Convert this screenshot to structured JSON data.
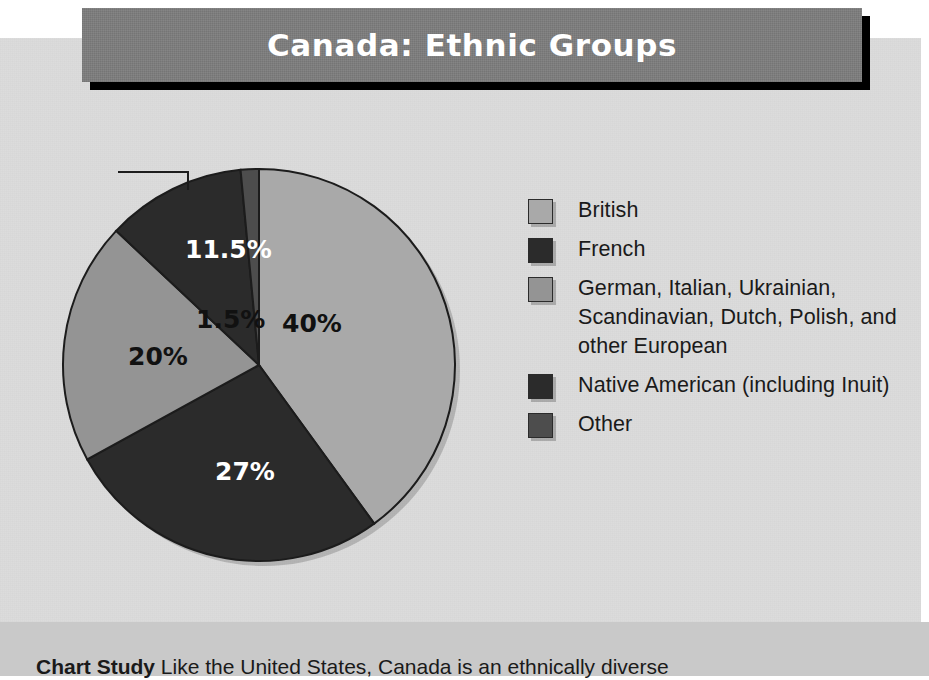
{
  "title": "Canada: Ethnic Groups",
  "caption": {
    "lead": "Chart Study",
    "text": "Like the United States, Canada is an ethnically diverse"
  },
  "colors": {
    "panel_background": "#dcdcdc",
    "page_band": "#c9c9c9",
    "title_bar": "#7d7d7d",
    "title_shadow": "#000000",
    "title_text": "#ffffff",
    "british": "#a9a9a9",
    "french": "#2b2b2b",
    "european": "#949494",
    "native_american": "#2b2b2b",
    "other": "#4d4d4d",
    "outline": "#1c1c1c"
  },
  "legend": {
    "items": [
      {
        "label": "British",
        "color": "#a9a9a9"
      },
      {
        "label": "French",
        "color": "#2b2b2b"
      },
      {
        "label": "German, Italian, Ukrainian, Scandinavian, Dutch, Polish, and other European",
        "color": "#949494"
      },
      {
        "label": "Native American (including Inuit)",
        "color": "#2b2b2b"
      },
      {
        "label": "Other",
        "color": "#4d4d4d"
      }
    ]
  },
  "callout": {
    "label": "1.5%"
  },
  "chart_data": {
    "type": "pie",
    "title": "Canada: Ethnic Groups",
    "start_angle_deg": 0,
    "direction": "clockwise",
    "legend_position": "right",
    "labels_shown": [
      "40%",
      "27%",
      "20%",
      "11.5%",
      "1.5%"
    ],
    "categories": [
      "British",
      "French",
      "German, Italian, Ukrainian, Scandinavian, Dutch, Polish, and other European",
      "Native American (including Inuit)",
      "Other"
    ],
    "values": [
      40,
      27,
      20,
      11.5,
      1.5
    ],
    "slices": [
      {
        "name": "British",
        "value": 40,
        "display": "40%",
        "color": "#a9a9a9",
        "label_fill": "dark",
        "label_x": 282,
        "label_y": 332
      },
      {
        "name": "French",
        "value": 27,
        "display": "27%",
        "color": "#2b2b2b",
        "label_fill": "light",
        "label_x": 215,
        "label_y": 480
      },
      {
        "name": "German, Italian, Ukrainian, Scandinavian, Dutch, Polish, and other European",
        "value": 20,
        "display": "20%",
        "color": "#949494",
        "label_fill": "dark",
        "label_x": 128,
        "label_y": 365
      },
      {
        "name": "Native American (including Inuit)",
        "value": 11.5,
        "display": "11.5%",
        "color": "#2b2b2b",
        "label_fill": "light",
        "label_x": 185,
        "label_y": 258
      },
      {
        "name": "Other",
        "value": 1.5,
        "display": "1.5%",
        "color": "#4d4d4d",
        "label_fill": "dark",
        "label_x": 141,
        "label_y": 158,
        "callout": true
      }
    ]
  }
}
